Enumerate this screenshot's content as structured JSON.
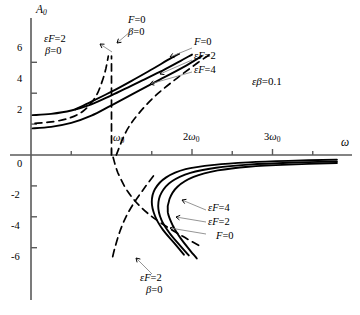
{
  "figure": {
    "name": "frequency-response-curves",
    "axis": {
      "x_title": "ω",
      "y_title": "A",
      "y_title_sub": "0",
      "x_ticks": [
        "ω₀",
        "2ω₀",
        "3ω₀"
      ],
      "x_tick_main": [
        "ω",
        "2ω",
        "3ω"
      ],
      "x_tick_sub": [
        "0",
        "0",
        "0"
      ],
      "y_ticks": [
        "6",
        "4",
        "2",
        "0",
        "-2",
        "-4",
        "-6"
      ]
    },
    "annotations": {
      "param": "εβ=0.1",
      "upper_left": {
        "line1": "εF=2",
        "line2": "β=0"
      },
      "upper_mid": {
        "line1": "F=0",
        "line2": "β=0"
      },
      "upper_right": [
        "F=0",
        "εF=2",
        "εF=4"
      ],
      "lower_right": [
        "εF=4",
        "εF=2",
        "F=0"
      ],
      "lower_center": {
        "line1": "εF=2",
        "line2": "β=0"
      }
    },
    "colors": {
      "axis": "#5a5a5a",
      "curve": "#000000",
      "background": "#ffffff"
    }
  },
  "chart_data": {
    "type": "line",
    "title": "",
    "xlabel": "ω",
    "ylabel": "A0",
    "xlim": [
      0,
      3.85
    ],
    "ylim": [
      -7.0,
      6.8
    ],
    "xlim_units": "ω0",
    "grid": false,
    "legend": "inline-annotations",
    "parameter": "εβ=0.1",
    "xticks": [
      1,
      2,
      3
    ],
    "xticklabels": [
      "ω₀",
      "2ω₀",
      "3ω₀"
    ],
    "yticks": [
      6,
      4,
      2,
      0,
      -2,
      -4,
      -6
    ],
    "yticklabels": [
      "6",
      "4",
      "2",
      "0",
      "-2",
      "-4",
      "-6"
    ],
    "series": [
      {
        "name": "F=0, β=0 (undamped backbone, upper)",
        "style": "dashed",
        "branch": "upper",
        "label": "F=0 β=0",
        "points": [
          [
            1.0,
            0.0
          ],
          [
            1.0,
            1.6
          ],
          [
            1.0,
            3.2
          ],
          [
            1.0,
            4.8
          ],
          [
            1.0,
            6.4
          ]
        ]
      },
      {
        "name": "εF=2, β=0 (undamped, upper-left branch)",
        "style": "dashed",
        "branch": "upper-left",
        "label": "εF=2 β=0",
        "points": [
          [
            0.05,
            2.05
          ],
          [
            0.22,
            2.12
          ],
          [
            0.45,
            2.35
          ],
          [
            0.65,
            2.85
          ],
          [
            0.8,
            3.75
          ],
          [
            0.88,
            4.7
          ],
          [
            0.93,
            5.6
          ],
          [
            0.96,
            6.4
          ]
        ]
      },
      {
        "name": "εF=2, β=0 (undamped, upper-right branch)",
        "style": "dashed",
        "branch": "upper-right",
        "label": "εF=2 β=0",
        "points": [
          [
            1.06,
            0.0
          ],
          [
            1.18,
            1.5
          ],
          [
            1.34,
            2.7
          ],
          [
            1.56,
            3.9
          ],
          [
            1.82,
            5.0
          ],
          [
            2.08,
            6.0
          ],
          [
            2.22,
            6.5
          ]
        ]
      },
      {
        "name": "F=0 (damped, upper)",
        "style": "solid",
        "branch": "upper",
        "label": "F=0",
        "points": [
          [
            0.02,
            1.72
          ],
          [
            0.25,
            1.82
          ],
          [
            0.5,
            2.08
          ],
          [
            0.75,
            2.55
          ],
          [
            1.0,
            3.22
          ],
          [
            1.3,
            4.05
          ],
          [
            1.6,
            4.88
          ],
          [
            1.9,
            5.7
          ],
          [
            2.12,
            6.4
          ]
        ]
      },
      {
        "name": "εF=2 (damped, upper)",
        "style": "solid",
        "branch": "upper",
        "label": "εF=2",
        "points": [
          [
            0.02,
            2.58
          ],
          [
            0.25,
            2.66
          ],
          [
            0.5,
            2.88
          ],
          [
            0.75,
            3.28
          ],
          [
            1.0,
            3.86
          ],
          [
            1.3,
            4.62
          ],
          [
            1.6,
            5.38
          ],
          [
            1.86,
            6.1
          ],
          [
            2.0,
            6.5
          ]
        ]
      },
      {
        "name": "εF=4 (damped, upper)",
        "style": "solid",
        "branch": "upper",
        "label": "εF=4",
        "points": [
          [
            0.55,
            2.95
          ],
          [
            0.75,
            3.45
          ],
          [
            1.0,
            4.1
          ],
          [
            1.25,
            4.8
          ],
          [
            1.52,
            5.6
          ],
          [
            1.75,
            6.3
          ],
          [
            1.84,
            6.55
          ]
        ]
      },
      {
        "name": "εF=2, β=0 (undamped, lower branch A)",
        "style": "dashed",
        "branch": "lower",
        "label": "εF=2 β=0",
        "points": [
          [
            1.02,
            -0.15
          ],
          [
            1.08,
            -1.15
          ],
          [
            1.2,
            -2.35
          ],
          [
            1.38,
            -3.45
          ],
          [
            1.6,
            -4.35
          ],
          [
            1.88,
            -5.25
          ],
          [
            2.1,
            -5.9
          ]
        ]
      },
      {
        "name": "εF=2, β=0 (undamped, lower branch B)",
        "style": "dashed",
        "branch": "lower",
        "label": "εF=2 β=0",
        "points": [
          [
            1.52,
            -1.35
          ],
          [
            1.4,
            -2.2
          ],
          [
            1.28,
            -3.1
          ],
          [
            1.18,
            -4.0
          ],
          [
            1.1,
            -5.0
          ],
          [
            1.04,
            -6.05
          ],
          [
            1.01,
            -6.7
          ]
        ]
      },
      {
        "name": "F=0 (damped, lower)",
        "style": "solid",
        "branch": "lower",
        "label": "F=0",
        "points": [
          [
            3.8,
            -0.42
          ],
          [
            3.2,
            -0.5
          ],
          [
            2.7,
            -0.62
          ],
          [
            2.3,
            -0.82
          ],
          [
            1.98,
            -1.15
          ],
          [
            1.75,
            -1.7
          ],
          [
            1.62,
            -2.45
          ],
          [
            1.58,
            -3.3
          ],
          [
            1.62,
            -4.2
          ],
          [
            1.72,
            -5.05
          ],
          [
            1.85,
            -5.85
          ],
          [
            1.96,
            -6.5
          ]
        ]
      },
      {
        "name": "εF=2 (damped, lower)",
        "style": "solid",
        "branch": "lower",
        "label": "εF=2",
        "points": [
          [
            3.8,
            -0.52
          ],
          [
            3.2,
            -0.62
          ],
          [
            2.7,
            -0.76
          ],
          [
            2.32,
            -1.0
          ],
          [
            2.02,
            -1.42
          ],
          [
            1.82,
            -2.05
          ],
          [
            1.72,
            -2.85
          ],
          [
            1.7,
            -3.7
          ],
          [
            1.76,
            -4.55
          ],
          [
            1.86,
            -5.4
          ],
          [
            1.98,
            -6.2
          ],
          [
            2.06,
            -6.7
          ]
        ]
      },
      {
        "name": "εF=4 (damped, lower)",
        "style": "solid",
        "branch": "lower",
        "label": "εF=4",
        "points": [
          [
            3.8,
            -0.3
          ],
          [
            3.2,
            -0.38
          ],
          [
            2.7,
            -0.48
          ],
          [
            2.28,
            -0.64
          ],
          [
            1.92,
            -0.92
          ],
          [
            1.68,
            -1.45
          ],
          [
            1.54,
            -2.2
          ],
          [
            1.5,
            -3.05
          ],
          [
            1.54,
            -3.95
          ],
          [
            1.64,
            -4.85
          ],
          [
            1.78,
            -5.7
          ],
          [
            1.9,
            -6.45
          ]
        ]
      }
    ]
  }
}
